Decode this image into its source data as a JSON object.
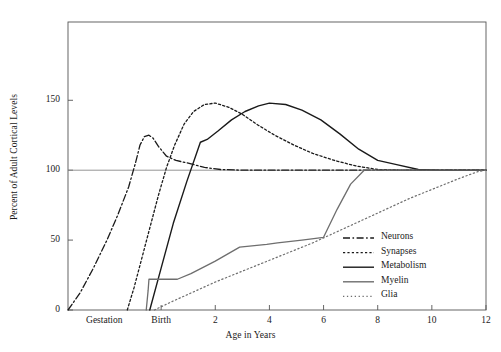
{
  "chart_data": {
    "type": "line",
    "title": "",
    "xlabel": "Age in Years",
    "ylabel": "Percent of Adult Cortical Levels",
    "xlim": [
      -3.44,
      12
    ],
    "ylim": [
      0,
      206
    ],
    "grid": false,
    "reference_line": {
      "y": 100,
      "label": "100"
    },
    "legend_position": "bottom-right",
    "x_ticks": [
      {
        "value": 0,
        "label": "Birth"
      },
      {
        "value": 2,
        "label": "2"
      },
      {
        "value": 4,
        "label": "4"
      },
      {
        "value": 6,
        "label": "6"
      },
      {
        "value": 8,
        "label": "8"
      },
      {
        "value": 10,
        "label": "10"
      },
      {
        "value": 12,
        "label": "12"
      }
    ],
    "x_region_labels": [
      {
        "value": -2.1,
        "label": "Gestation"
      }
    ],
    "y_ticks": [
      {
        "value": 0,
        "label": "0"
      },
      {
        "value": 50,
        "label": "50"
      },
      {
        "value": 100,
        "label": "100"
      },
      {
        "value": 150,
        "label": "150"
      }
    ],
    "series": [
      {
        "name": "Neurons",
        "style": "dashdot",
        "color": "#1a1a1a",
        "width": 1.3,
        "points": [
          [
            -3.44,
            0
          ],
          [
            -3.0,
            12
          ],
          [
            -2.5,
            30
          ],
          [
            -2.0,
            50
          ],
          [
            -1.6,
            68
          ],
          [
            -1.2,
            88
          ],
          [
            -0.95,
            105
          ],
          [
            -0.78,
            118
          ],
          [
            -0.62,
            124
          ],
          [
            -0.45,
            125
          ],
          [
            -0.3,
            123
          ],
          [
            -0.1,
            117
          ],
          [
            0.2,
            110
          ],
          [
            0.55,
            107
          ],
          [
            1.0,
            105
          ],
          [
            1.6,
            102
          ],
          [
            2.2,
            100.5
          ],
          [
            3.0,
            100
          ],
          [
            5.0,
            100
          ],
          [
            8.0,
            100
          ],
          [
            12.0,
            100
          ]
        ]
      },
      {
        "name": "Synapses",
        "style": "dotted",
        "color": "#1a1a1a",
        "width": 1.3,
        "points": [
          [
            -1.25,
            0
          ],
          [
            -1.0,
            16
          ],
          [
            -0.7,
            38
          ],
          [
            -0.4,
            60
          ],
          [
            -0.1,
            82
          ],
          [
            0.2,
            102
          ],
          [
            0.5,
            118
          ],
          [
            0.85,
            133
          ],
          [
            1.2,
            142
          ],
          [
            1.6,
            147
          ],
          [
            2.0,
            148
          ],
          [
            2.5,
            145
          ],
          [
            3.0,
            140
          ],
          [
            3.6,
            132
          ],
          [
            4.2,
            125
          ],
          [
            4.9,
            118
          ],
          [
            5.6,
            112
          ],
          [
            6.4,
            107
          ],
          [
            7.2,
            103
          ],
          [
            8.0,
            100.5
          ],
          [
            9.0,
            100
          ],
          [
            12.0,
            100
          ]
        ]
      },
      {
        "name": "Metabolism",
        "style": "solid",
        "color": "#1a1a1a",
        "width": 1.4,
        "points": [
          [
            -0.42,
            0
          ],
          [
            0.0,
            30
          ],
          [
            0.45,
            62
          ],
          [
            0.95,
            92
          ],
          [
            1.45,
            120
          ],
          [
            1.7,
            122
          ],
          [
            2.1,
            128
          ],
          [
            2.6,
            136
          ],
          [
            3.1,
            142
          ],
          [
            3.6,
            146
          ],
          [
            4.0,
            148
          ],
          [
            4.6,
            147
          ],
          [
            5.2,
            143
          ],
          [
            5.9,
            136
          ],
          [
            6.6,
            126
          ],
          [
            7.3,
            115
          ],
          [
            8.0,
            107
          ],
          [
            8.7,
            104
          ],
          [
            9.5,
            100.5
          ],
          [
            10.2,
            100
          ],
          [
            12.0,
            100
          ]
        ]
      },
      {
        "name": "Myelin",
        "style": "solid",
        "color": "#6e6e6e",
        "width": 1.3,
        "points": [
          [
            -0.55,
            0
          ],
          [
            -0.48,
            14
          ],
          [
            -0.45,
            22
          ],
          [
            0.6,
            22
          ],
          [
            1.1,
            26
          ],
          [
            2.0,
            35
          ],
          [
            2.9,
            45
          ],
          [
            3.9,
            47
          ],
          [
            4.3,
            48
          ],
          [
            5.2,
            50
          ],
          [
            6.0,
            52
          ],
          [
            6.5,
            72
          ],
          [
            7.0,
            90
          ],
          [
            7.5,
            100
          ],
          [
            9.0,
            100
          ],
          [
            12.0,
            100
          ]
        ]
      },
      {
        "name": "Glia",
        "style": "dotted-fine",
        "color": "#6e6e6e",
        "width": 1.2,
        "points": [
          [
            -0.25,
            0
          ],
          [
            0.4,
            6
          ],
          [
            1.2,
            13
          ],
          [
            2.0,
            20
          ],
          [
            2.9,
            27
          ],
          [
            3.8,
            34
          ],
          [
            4.7,
            41
          ],
          [
            5.6,
            48
          ],
          [
            6.5,
            56
          ],
          [
            7.4,
            64
          ],
          [
            8.3,
            72
          ],
          [
            9.2,
            80
          ],
          [
            10.1,
            87
          ],
          [
            11.0,
            94
          ],
          [
            11.7,
            99
          ],
          [
            12.0,
            100
          ]
        ]
      }
    ],
    "legend_entries": [
      {
        "label": "Neurons",
        "style": "dashdot",
        "color": "#1a1a1a"
      },
      {
        "label": "Synapses",
        "style": "dotted",
        "color": "#1a1a1a"
      },
      {
        "label": "Metabolism",
        "style": "solid",
        "color": "#1a1a1a"
      },
      {
        "label": "Myelin",
        "style": "solid",
        "color": "#6e6e6e"
      },
      {
        "label": "Glia",
        "style": "dotted-fine",
        "color": "#6e6e6e"
      }
    ]
  }
}
